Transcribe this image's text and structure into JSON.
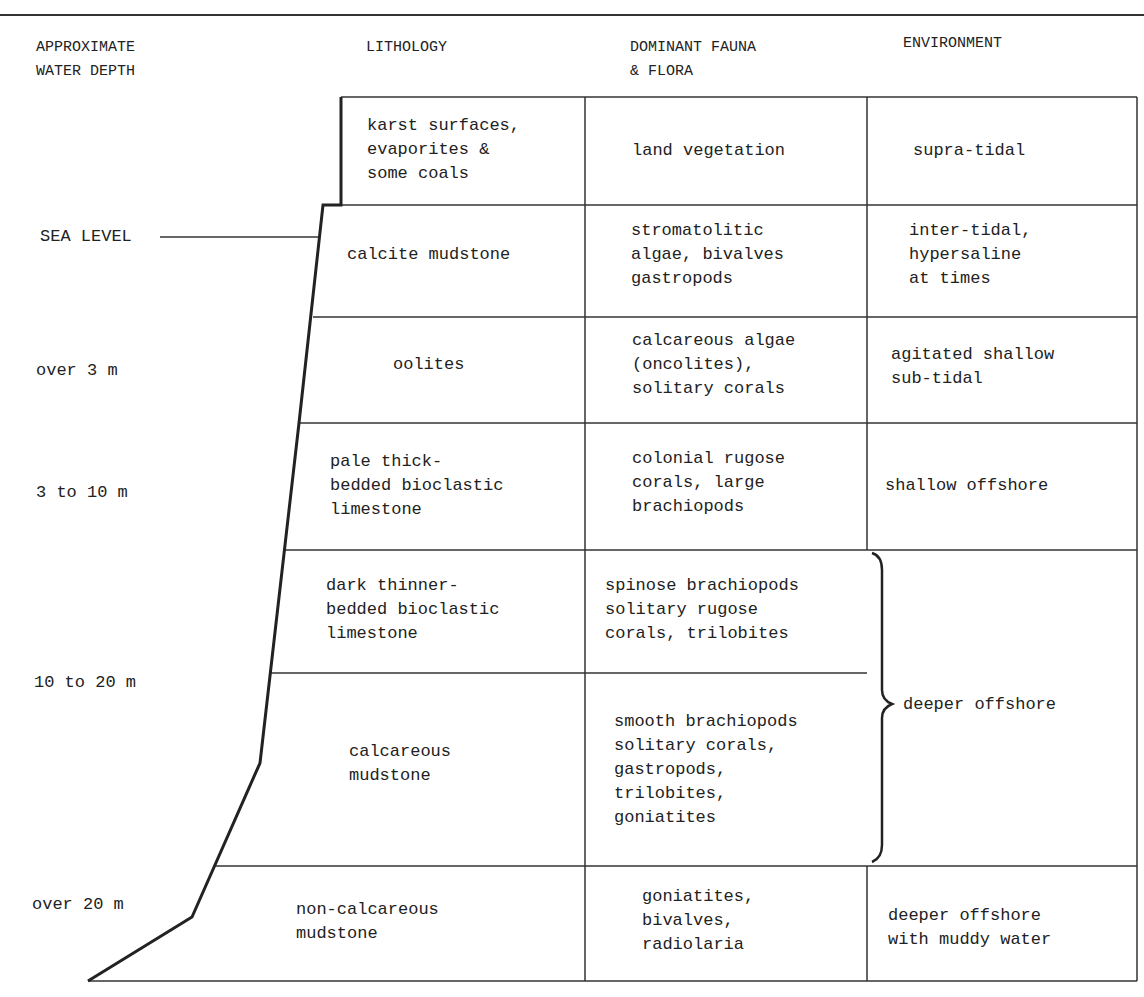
{
  "headers": {
    "depth": "APPROXIMATE\nWATER DEPTH",
    "lithology": "LITHOLOGY",
    "fauna": "DOMINANT FAUNA\n& FLORA",
    "environment": "ENVIRONMENT"
  },
  "sea_level_label": "SEA LEVEL",
  "depths": [
    "over 3 m",
    "3 to 10 m",
    "10 to 20 m",
    "over 20 m"
  ],
  "rows": [
    {
      "lithology": "karst surfaces,\nevaporites &\nsome coals",
      "fauna": "land vegetation",
      "environment": "supra-tidal"
    },
    {
      "lithology": "calcite mudstone",
      "fauna": "stromatolitic\nalgae, bivalves\ngastropods",
      "environment": "inter-tidal,\nhypersaline\nat times"
    },
    {
      "lithology": "oolites",
      "fauna": "calcareous algae\n(oncolites),\nsolitary corals",
      "environment": "agitated shallow\nsub-tidal"
    },
    {
      "lithology": "pale thick-\nbedded bioclastic\nlimestone",
      "fauna": "colonial rugose\ncorals, large\nbrachiopods",
      "environment": "shallow offshore"
    },
    {
      "lithology": "dark thinner-\nbedded bioclastic\nlimestone",
      "fauna": "spinose brachiopods\nsolitary rugose\ncorals, trilobites",
      "environment": "deeper offshore"
    },
    {
      "lithology": "calcareous\nmudstone",
      "fauna": "smooth brachiopods\nsolitary corals,\ngastropods,\ntrilobites,\ngoniatites",
      "environment": "deeper offshore"
    },
    {
      "lithology": "non-calcareous\nmudstone",
      "fauna": "goniatites,\nbivalves,\nradiolaria",
      "environment": "deeper offshore\nwith muddy water"
    }
  ]
}
